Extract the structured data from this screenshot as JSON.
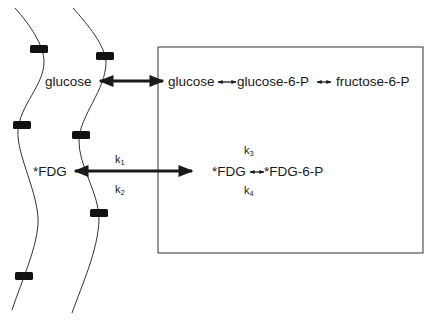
{
  "diagram": {
    "title": "",
    "colors": {
      "ink": "#1a1a1a",
      "background": "#ffffff",
      "transporter": "#111111"
    },
    "extracellular": {
      "glucose_label": "glucose",
      "fdg_label": "*FDG"
    },
    "cell": {
      "glucose_label": "glucose",
      "glucose6p_label": "glucose-6-P",
      "fructose6p_label": "fructose-6-P",
      "fdg_label": "*FDG",
      "fdg6p_label": "*FDG-6-P"
    },
    "rate_constants": {
      "k1": {
        "base": "k",
        "sub": "1"
      },
      "k2": {
        "base": "k",
        "sub": "2"
      },
      "k3": {
        "base": "k",
        "sub": "3"
      },
      "k4": {
        "base": "k",
        "sub": "4"
      }
    },
    "membranes": [
      "membrane-left",
      "membrane-right"
    ],
    "transporter_count": 6
  }
}
